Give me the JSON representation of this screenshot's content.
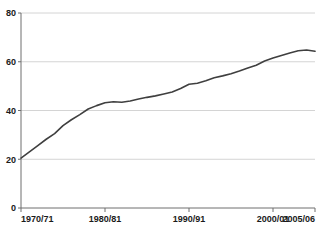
{
  "chart_data": {
    "type": "line",
    "title": "",
    "subtitle": "",
    "xlabel": "",
    "ylabel": "",
    "grid": "horizontal",
    "legend": "none",
    "ylim": [
      0,
      80
    ],
    "yticks": [
      "0",
      "20",
      "40",
      "60",
      "80"
    ],
    "ytick_values": [
      0,
      20,
      40,
      60,
      80
    ],
    "xticks": [
      "1970/71",
      "1980/81",
      "1990/91",
      "2000/01",
      "2005/06"
    ],
    "xtick_indices": [
      0,
      10,
      20,
      30,
      35
    ],
    "categories": [
      "1970/71",
      "1971/72",
      "1972/73",
      "1973/74",
      "1974/75",
      "1975/76",
      "1976/77",
      "1977/78",
      "1978/79",
      "1979/80",
      "1980/81",
      "1981/82",
      "1982/83",
      "1983/84",
      "1984/85",
      "1985/86",
      "1986/87",
      "1987/88",
      "1988/89",
      "1989/90",
      "1990/91",
      "1991/92",
      "1992/93",
      "1993/94",
      "1994/95",
      "1995/96",
      "1996/97",
      "1997/98",
      "1998/99",
      "1999/00",
      "2000/01",
      "2001/02",
      "2002/03",
      "2003/04",
      "2004/05",
      "2005/06"
    ],
    "series": [
      {
        "name": "series-1",
        "color": "#3f3f3f",
        "values": [
          20.5,
          23.0,
          25.6,
          28.2,
          30.5,
          33.8,
          36.2,
          38.3,
          40.6,
          42.0,
          43.2,
          43.6,
          43.4,
          43.9,
          44.7,
          45.4,
          46.0,
          46.8,
          47.6,
          49.0,
          50.8,
          51.2,
          52.2,
          53.4,
          54.2,
          55.1,
          56.2,
          57.4,
          58.6,
          60.3,
          61.5,
          62.6,
          63.6,
          64.5,
          64.8,
          64.3
        ]
      }
    ]
  },
  "colors": {
    "line": "#3f3f3f",
    "grid": "#d4d4d4",
    "axis": "#6e6e6e",
    "text": "#1a1a1a",
    "background": "#ffffff"
  }
}
